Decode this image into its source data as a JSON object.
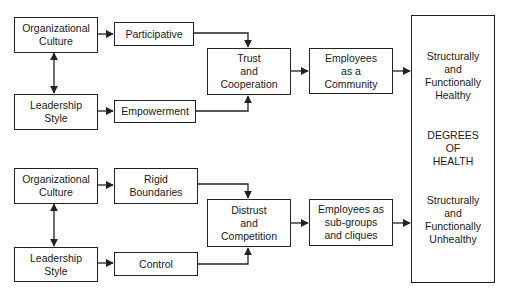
{
  "top": {
    "org_culture": "Organizational\nCulture",
    "leadership": "Leadership\nStyle",
    "mediator_1": "Participative",
    "mediator_2": "Empowerment",
    "climate": "Trust\nand\nCooperation",
    "employees": "Employees\nas a\nCommunity"
  },
  "bottom": {
    "org_culture": "Organizational\nCulture",
    "leadership": "Leadership\nStyle",
    "mediator_1": "Rigid\nBoundaries",
    "mediator_2": "Control",
    "climate": "Distrust\nand\nCompetition",
    "employees": "Employees as\nsub-groups\nand cliques"
  },
  "outcome": {
    "healthy": "Structurally\nand\nFunctionally\nHealthy",
    "center": "DEGREES\nOF\nHEALTH",
    "unhealthy": "Structurally\nand\nFunctionally\nUnhealthy"
  }
}
